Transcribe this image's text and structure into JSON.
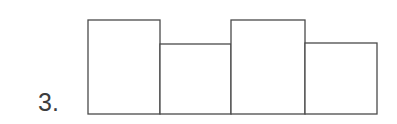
{
  "figure": {
    "item_number": "3.",
    "line_color": "#4a4a4a",
    "fill_color": "#ffffff",
    "background_color": "#ffffff"
  },
  "chart_data": {
    "type": "bar",
    "title": "",
    "subtitle": "",
    "xlabel": "",
    "ylabel": "",
    "categories": [
      "1",
      "2",
      "3",
      "4"
    ],
    "values": [
      94,
      70,
      94,
      71
    ],
    "ylim": [
      0,
      114
    ],
    "xlim": [
      0,
      4
    ],
    "grid": false,
    "legend": null,
    "axis_ticks_visible": false,
    "tick_labels": [],
    "annotations": [],
    "bars": [
      {
        "index": 1,
        "label": "1",
        "value": 94,
        "height_class": "tall",
        "x": 88,
        "width": 72,
        "top": 20,
        "bottom": 114
      },
      {
        "index": 2,
        "label": "2",
        "value": 70,
        "height_class": "short",
        "x": 160,
        "width": 71,
        "top": 44,
        "bottom": 114
      },
      {
        "index": 3,
        "label": "3",
        "value": 94,
        "height_class": "tall",
        "x": 231,
        "width": 74,
        "top": 20,
        "bottom": 114
      },
      {
        "index": 4,
        "label": "4",
        "value": 71,
        "height_class": "short",
        "x": 305,
        "width": 72,
        "top": 43,
        "bottom": 114
      }
    ]
  }
}
